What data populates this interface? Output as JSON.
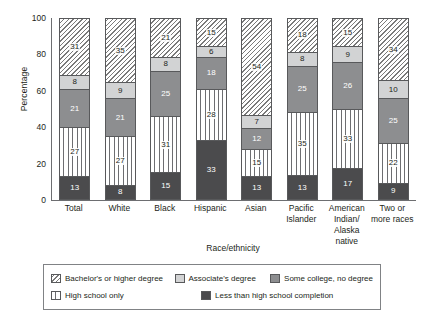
{
  "chart_data": {
    "type": "bar",
    "subtype": "stacked-bar-100",
    "title": "",
    "xlabel": "Race/ethnicity",
    "ylabel": "Percentage",
    "ylim": [
      0,
      100
    ],
    "yticks": [
      0,
      20,
      40,
      60,
      80,
      100
    ],
    "grid": false,
    "legend_position": "bottom",
    "categories": [
      "Total",
      "White",
      "Black",
      "Hispanic",
      "Asian",
      "Pacific Islander",
      "American Indian/ Alaska native",
      "Two or more races"
    ],
    "category_lines": [
      [
        "Total"
      ],
      [
        "White"
      ],
      [
        "Black"
      ],
      [
        "Hispanic"
      ],
      [
        "Asian"
      ],
      [
        "Pacific",
        "Islander"
      ],
      [
        "American",
        "Indian/",
        "Alaska native"
      ],
      [
        "Two or",
        "more races"
      ]
    ],
    "series": [
      {
        "name": "Less than high school completion",
        "key": "lessthan",
        "fill": "solid-dark",
        "color": "#4b4b4d",
        "values": [
          13,
          8,
          15,
          33,
          13,
          13,
          17,
          9
        ]
      },
      {
        "name": "High school only",
        "key": "highschool",
        "fill": "vertical-lines",
        "color": "#ffffff",
        "values": [
          27,
          27,
          31,
          28,
          15,
          35,
          33,
          22
        ]
      },
      {
        "name": "Some college, no degree",
        "key": "somecollege",
        "fill": "solid-mid-gray",
        "color": "#8d8e90",
        "values": [
          21,
          21,
          25,
          18,
          12,
          25,
          26,
          25
        ]
      },
      {
        "name": "Associate's degree",
        "key": "associate",
        "fill": "solid-light-gray",
        "color": "#d2d3d4",
        "values": [
          8,
          9,
          8,
          6,
          7,
          8,
          9,
          10
        ]
      },
      {
        "name": "Bachelor's or higher degree",
        "key": "bachelor",
        "fill": "diagonal-hatch",
        "color": "#ffffff",
        "values": [
          31,
          35,
          21,
          15,
          54,
          18,
          15,
          34
        ]
      }
    ]
  },
  "legend": {
    "items": [
      {
        "label": "Bachelor's or higher degree",
        "key": "bachelor"
      },
      {
        "label": "Associate's degree",
        "key": "associate"
      },
      {
        "label": "Some college, no degree",
        "key": "somecollege"
      },
      {
        "label": "High school only",
        "key": "highschool"
      },
      {
        "label": "Less than high school completion",
        "key": "lessthan"
      }
    ]
  }
}
